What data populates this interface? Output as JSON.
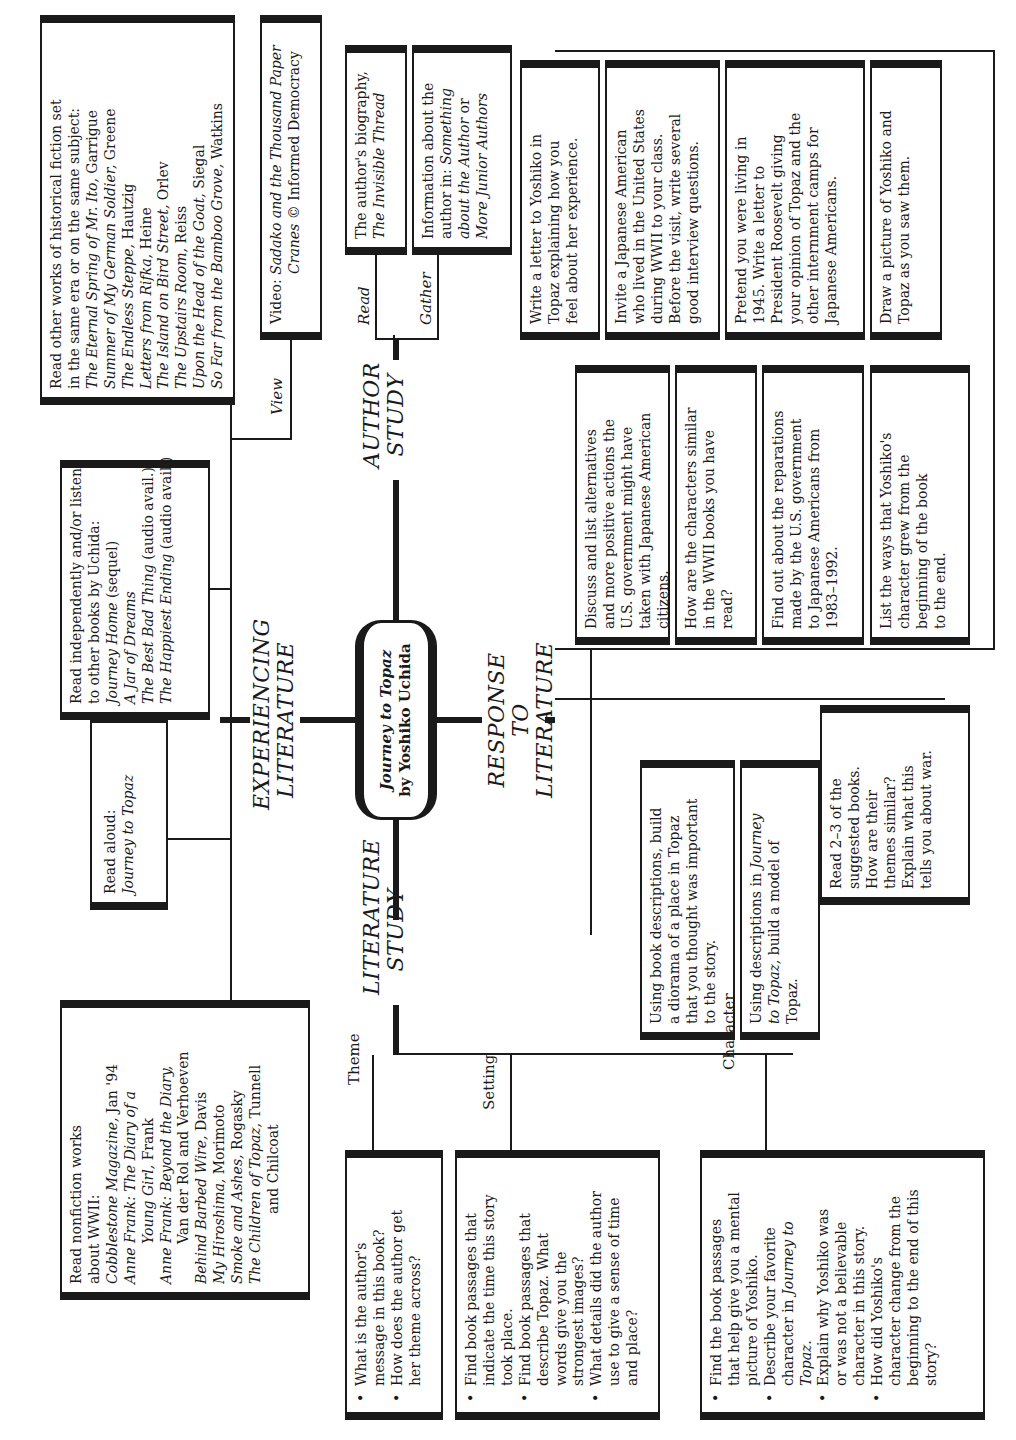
{
  "center": {
    "title": "Journey to Topaz",
    "subtitle": "by Yoshiko Uchida"
  },
  "branches": {
    "experiencing": {
      "line1": "EXPERIENCING",
      "line2": "LITERATURE"
    },
    "author": {
      "line1": "AUTHOR",
      "line2": "STUDY"
    },
    "response": {
      "line1": "RESPONSE TO",
      "line2": "LITERATURE"
    },
    "literature": {
      "line1": "LITERATURE",
      "line2": "STUDY"
    }
  },
  "experiencing_literature": {
    "view_label": "View",
    "historical_fiction": {
      "intro1": "Read other works of historical fiction set",
      "intro2": "in the same era or on the same subject:",
      "books": [
        {
          "title": "The Eternal Spring of Mr. Ito,",
          "author": " Garrigue"
        },
        {
          "title": "Summer of My German Soldier,",
          "author": " Greene"
        },
        {
          "title": "The Endless Steppe,",
          "author": " Hautzig"
        },
        {
          "title": "Letters from Rifka,",
          "author": " Heine"
        },
        {
          "title": "The Island on Bird Street,",
          "author": " Orlev"
        },
        {
          "title": "The Upstairs Room,",
          "author": " Reiss"
        },
        {
          "title": "Upon the Head of the Goat,",
          "author": " Siegal"
        },
        {
          "title": "So Far from the Bamboo Grove,",
          "author": " Watkins"
        }
      ]
    },
    "video": {
      "prefix": "Video: ",
      "title1": "Sadako and the Thousand Paper",
      "title2": "Cranes",
      "suffix": " © Informed Democracy"
    },
    "uchida_books": {
      "intro1": "Read independently and/or listen",
      "intro2": "to other books by Uchida:",
      "books": [
        {
          "title": "Journey Home",
          "note": " (sequel)"
        },
        {
          "title": "A Jar of Dreams",
          "note": ""
        },
        {
          "title": "The Best Bad Thing",
          "note": " (audio avail.)"
        },
        {
          "title": "The Happiest Ending",
          "note": " (audio avail.)"
        }
      ]
    },
    "read_aloud": {
      "label": "Read aloud:",
      "title": "Journey to Topaz"
    },
    "nonfiction": {
      "intro1": "Read nonfiction works",
      "intro2": "about WWII:",
      "lines": [
        {
          "i": "Cobblestone Magazine,",
          "r": " Jan '94",
          "indent": false
        },
        {
          "i": "Anne Frank: The Diary of a",
          "r": "",
          "indent": false
        },
        {
          "i": "Young Girl,",
          "r": " Frank",
          "indent": true
        },
        {
          "i": "Anne Frank: Beyond the Diary,",
          "r": "",
          "indent": false
        },
        {
          "i": "",
          "r": "Van der Rol and Verhoeven",
          "indent": true
        },
        {
          "i": "Behind Barbed Wire,",
          "r": " Davis",
          "indent": false
        },
        {
          "i": "My Hiroshima,",
          "r": " Morimoto",
          "indent": false
        },
        {
          "i": "Smoke and Ashes,",
          "r": " Rogasky",
          "indent": false
        },
        {
          "i": "The Children of Topaz,",
          "r": " Tunnell",
          "indent": false
        },
        {
          "i": "",
          "r": "and Chilcoat",
          "indent": true
        }
      ]
    }
  },
  "author_study": {
    "read_label": "Read",
    "gather_label": "Gather",
    "biography": {
      "line1": "The author's biography,",
      "title": "The Invisible Thread"
    },
    "information": {
      "line1": "Information about the",
      "line2a": "author in: ",
      "line2b": "Something",
      "line3": "about the Author",
      "line3b": " or",
      "line4": "More Junior Authors"
    }
  },
  "response_to_literature": {
    "top_row": [
      {
        "lines": [
          "Draw a picture of Yoshiko and",
          "Topaz as you saw them."
        ]
      },
      {
        "lines": [
          "Pretend you were living in",
          "1945. Write a letter to",
          "President Roosevelt giving",
          "your opinion of Topaz and the",
          "other internment camps for",
          "Japanese Americans."
        ]
      },
      {
        "lines": [
          "Invite a Japanese American",
          "who lived in the United States",
          "during WWII to your class.",
          "Before the visit, write several",
          "good interview questions."
        ]
      },
      {
        "lines": [
          "Write a letter to Yoshiko in",
          "Topaz explaining how you",
          "feel about her experience."
        ]
      }
    ],
    "middle_row": [
      {
        "lines": [
          "List the ways that Yoshiko's",
          "character grew from the",
          "beginning of the book",
          "to the end."
        ]
      },
      {
        "lines": [
          "Find out about the reparations",
          "made by the U.S. government",
          "to Japanese Americans from",
          "1983–1992."
        ]
      },
      {
        "lines": [
          "How are the characters similar",
          "in the WWII books you have",
          "read?"
        ]
      },
      {
        "lines": [
          "Discuss and list alternatives",
          "and more positive actions the",
          "U.S. government might have",
          "taken with Japanese American",
          "citizens."
        ]
      }
    ],
    "bottom_row": [
      {
        "lines": [
          "Read 2–3 of the",
          "suggested books.",
          "How are their",
          "themes similar?",
          "Explain what this",
          "tells you about war."
        ]
      },
      {
        "pre": "Using descriptions in ",
        "ital1": "Journey",
        "ital2": "to Topaz,",
        "post2": " build a model of",
        "line3": "Topaz."
      },
      {
        "lines": [
          "Using book descriptions, build",
          "a diorama of a place in Topaz",
          "that you thought was important",
          "to the story."
        ]
      }
    ]
  },
  "literature_study": {
    "theme": {
      "label": "Theme",
      "bullets": [
        [
          "What is the author's",
          "message in this book?"
        ],
        [
          "How does the author get",
          "her theme across?"
        ]
      ]
    },
    "setting": {
      "label": "Setting",
      "bullets": [
        [
          "Find book passages that",
          "indicate the time this story",
          "took place."
        ],
        [
          "Find book passages that",
          "describe Topaz. What",
          "words give you the",
          "strongest images?"
        ],
        [
          "What details did the author",
          "use to give a sense of time",
          "and place?"
        ]
      ]
    },
    "character": {
      "label": "Character",
      "b1": [
        "Find the book passages",
        "that help give you a mental",
        "picture of Yoshiko."
      ],
      "b2a": "Describe your favorite",
      "b2b": "character in ",
      "b2c": "Journey to",
      "b2d": "Topaz.",
      "b3": [
        "Explain why Yoshiko was",
        "or was not a believable",
        "character in this story."
      ],
      "b4": [
        "How did Yoshiko's",
        "character change from the",
        "beginning to the end of this",
        "story?"
      ]
    }
  }
}
